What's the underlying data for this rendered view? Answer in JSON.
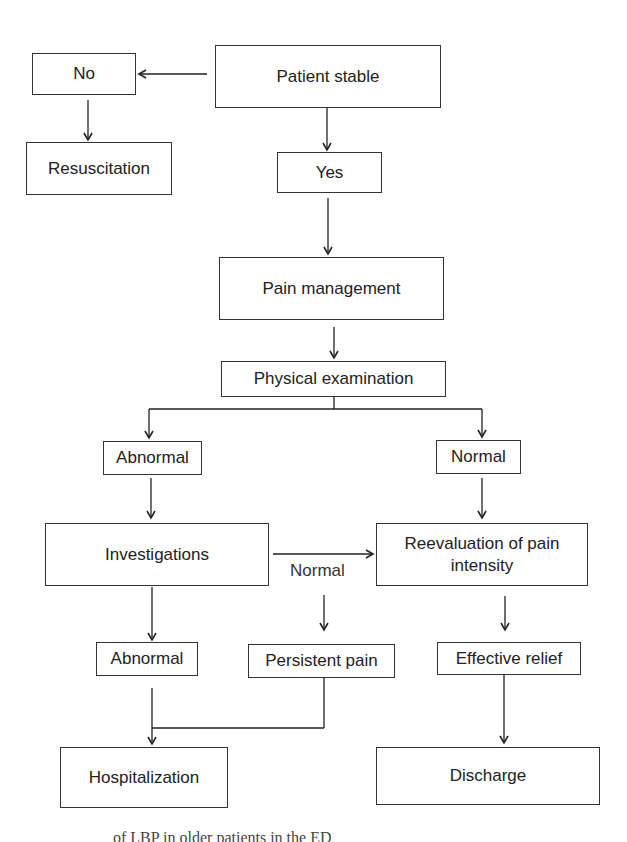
{
  "flowchart": {
    "nodes": {
      "patient_stable": "Patient stable",
      "no": "No",
      "resuscitation": "Resuscitation",
      "yes": "Yes",
      "pain_management": "Pain management",
      "physical_examination": "Physical examination",
      "abnormal_exam": "Abnormal",
      "normal_exam": "Normal",
      "investigations": "Investigations",
      "reevaluation": "Reevaluation of pain intensity",
      "abnormal_investigations": "Abnormal",
      "persistent_pain": "Persistent pain",
      "effective_relief": "Effective relief",
      "hospitalization": "Hospitalization",
      "discharge": "Discharge"
    },
    "edge_labels": {
      "investigations_normal": "Normal"
    },
    "edges": [
      [
        "patient_stable",
        "no"
      ],
      [
        "no",
        "resuscitation"
      ],
      [
        "patient_stable",
        "yes"
      ],
      [
        "yes",
        "pain_management"
      ],
      [
        "pain_management",
        "physical_examination"
      ],
      [
        "physical_examination",
        "abnormal_exam"
      ],
      [
        "physical_examination",
        "normal_exam"
      ],
      [
        "abnormal_exam",
        "investigations"
      ],
      [
        "normal_exam",
        "reevaluation"
      ],
      [
        "investigations",
        "reevaluation"
      ],
      [
        "investigations",
        "abnormal_investigations"
      ],
      [
        "investigations",
        "persistent_pain"
      ],
      [
        "reevaluation",
        "effective_relief"
      ],
      [
        "abnormal_investigations",
        "hospitalization"
      ],
      [
        "persistent_pain",
        "hospitalization"
      ],
      [
        "effective_relief",
        "discharge"
      ]
    ]
  },
  "caption": "of LBP in older patients in the ED"
}
